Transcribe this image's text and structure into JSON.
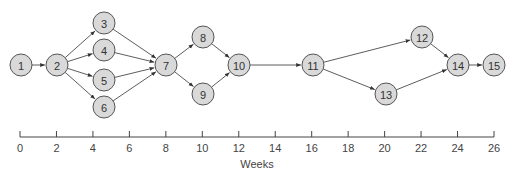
{
  "diagram": {
    "type": "network-schedule",
    "node_radius": 11,
    "colors": {
      "node_fill": "#d9d9d9",
      "node_stroke": "#555555",
      "edge": "#333333"
    },
    "nodes": [
      {
        "id": "1",
        "label": "1",
        "x": 21,
        "y": 65
      },
      {
        "id": "2",
        "label": "2",
        "x": 57,
        "y": 65
      },
      {
        "id": "3",
        "label": "3",
        "x": 104,
        "y": 23
      },
      {
        "id": "4",
        "label": "4",
        "x": 104,
        "y": 50
      },
      {
        "id": "5",
        "label": "5",
        "x": 104,
        "y": 80
      },
      {
        "id": "6",
        "label": "6",
        "x": 104,
        "y": 107
      },
      {
        "id": "7",
        "label": "7",
        "x": 166,
        "y": 65
      },
      {
        "id": "8",
        "label": "8",
        "x": 203,
        "y": 37
      },
      {
        "id": "9",
        "label": "9",
        "x": 203,
        "y": 94
      },
      {
        "id": "10",
        "label": "10",
        "x": 239,
        "y": 65
      },
      {
        "id": "11",
        "label": "11",
        "x": 313,
        "y": 65
      },
      {
        "id": "12",
        "label": "12",
        "x": 422,
        "y": 37
      },
      {
        "id": "13",
        "label": "13",
        "x": 386,
        "y": 94
      },
      {
        "id": "14",
        "label": "14",
        "x": 458,
        "y": 65
      },
      {
        "id": "15",
        "label": "15",
        "x": 494,
        "y": 65
      }
    ],
    "edges": [
      [
        "1",
        "2"
      ],
      [
        "2",
        "3"
      ],
      [
        "2",
        "4"
      ],
      [
        "2",
        "5"
      ],
      [
        "2",
        "6"
      ],
      [
        "3",
        "7"
      ],
      [
        "4",
        "7"
      ],
      [
        "5",
        "7"
      ],
      [
        "6",
        "7"
      ],
      [
        "7",
        "8"
      ],
      [
        "7",
        "9"
      ],
      [
        "8",
        "10"
      ],
      [
        "9",
        "10"
      ],
      [
        "10",
        "11"
      ],
      [
        "11",
        "12"
      ],
      [
        "11",
        "13"
      ],
      [
        "12",
        "14"
      ],
      [
        "13",
        "14"
      ],
      [
        "14",
        "15"
      ]
    ]
  },
  "axis": {
    "title": "Weeks",
    "y": 137,
    "x_start": 20,
    "x_end": 494,
    "min": 0,
    "max": 26,
    "ticks": [
      "0",
      "2",
      "4",
      "6",
      "8",
      "10",
      "12",
      "14",
      "16",
      "18",
      "20",
      "22",
      "24",
      "26"
    ]
  }
}
